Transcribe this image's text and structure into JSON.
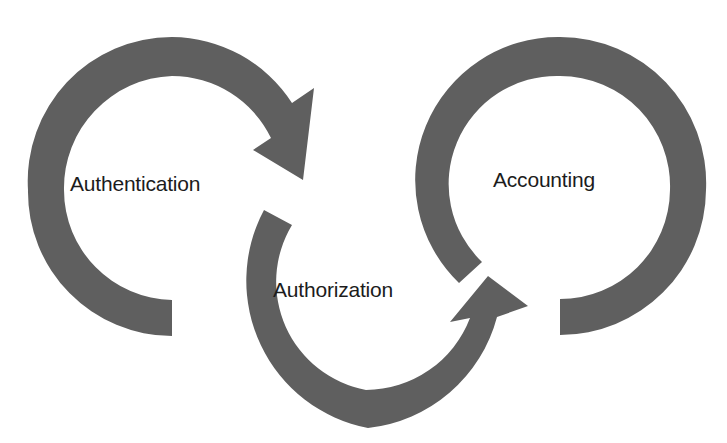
{
  "diagram": {
    "type": "cycle",
    "colors": {
      "arrow": "#5f5f5f",
      "text": "#1c1c1c",
      "background": "#ffffff"
    },
    "nodes": [
      {
        "id": "authentication",
        "label": "Authentication"
      },
      {
        "id": "authorization",
        "label": "Authorization"
      },
      {
        "id": "accounting",
        "label": "Accounting"
      }
    ],
    "edges": [
      {
        "from": "authentication",
        "to": "authorization"
      },
      {
        "from": "authorization",
        "to": "accounting"
      }
    ]
  }
}
